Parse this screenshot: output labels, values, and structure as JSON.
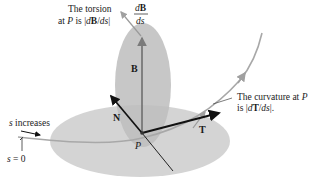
{
  "diagram": {
    "labels": {
      "torsion_line1": "The torsion",
      "torsion_line2_prefix": "at ",
      "torsion_line2_P": "P",
      "torsion_line2_mid": " is |",
      "torsion_line2_d": "d",
      "torsion_line2_B": "B",
      "torsion_line2_slash": "/",
      "torsion_line2_ds": "ds",
      "torsion_line2_end": "|",
      "dB_num_d": "d",
      "dB_num_B": "B",
      "dB_den": "ds",
      "curvature_line1_text": "The curvature at ",
      "curvature_line1_P": "P",
      "curvature_line2_prefix": "is |",
      "curvature_line2_d": "d",
      "curvature_line2_T": "T",
      "curvature_line2_slash": "/",
      "curvature_line2_ds": "ds",
      "curvature_line2_end": "|.",
      "s_increases_s": "s",
      "s_increases_text": " increases",
      "s_zero_s": "s",
      "s_zero_text": " = 0",
      "vector_B": "B",
      "vector_N": "N",
      "vector_T": "T",
      "point_P": "P"
    },
    "colors": {
      "plane_fill": "#c8c8c8",
      "osculating_plane_fill": "#bdbdbd",
      "curve": "#a8a8a8",
      "vector_dark": "#111111",
      "vector_B": "#6e6e6e",
      "leader": "#9a9a9a",
      "text": "#1a1a1a"
    }
  }
}
